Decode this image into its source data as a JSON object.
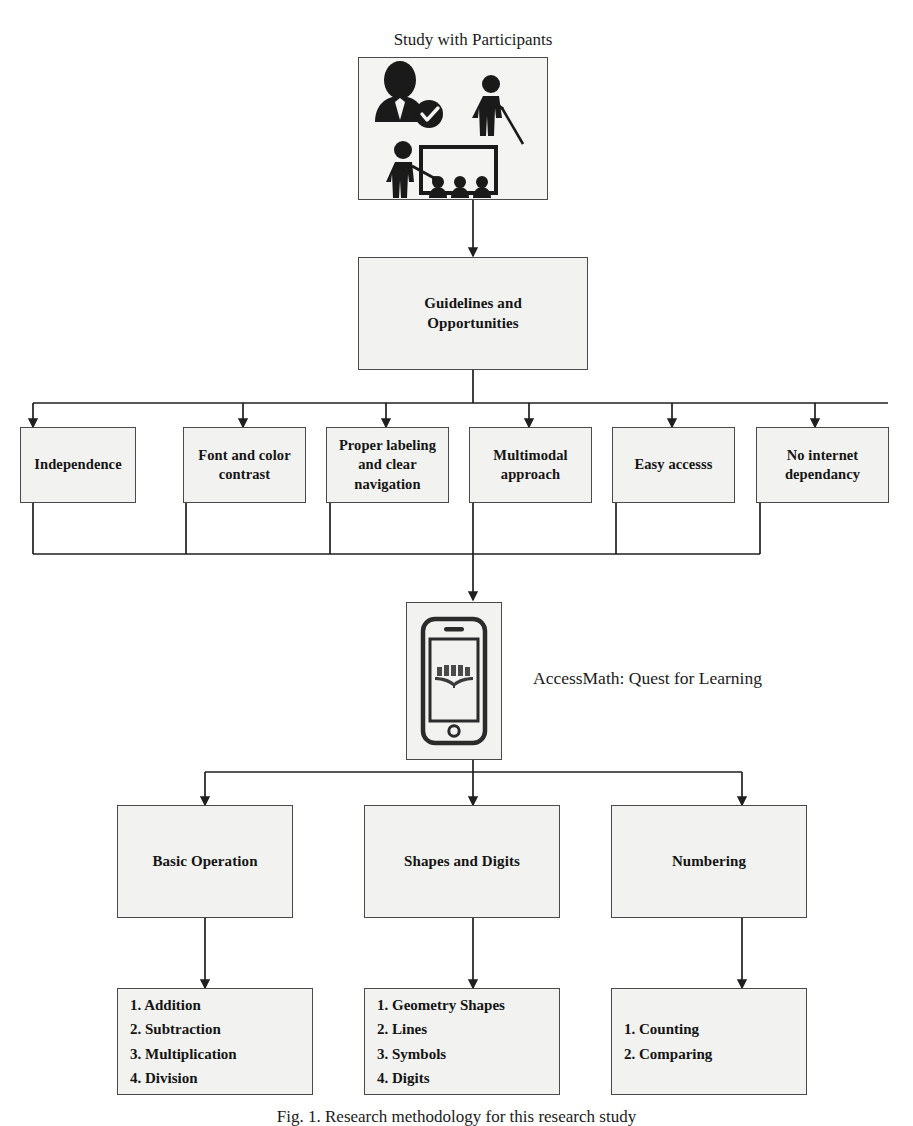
{
  "figure": {
    "title_above_image": "Study with Participants",
    "caption": "Fig. 1. Research methodology for this research study",
    "app_label": "AccessMath: Quest for Learning",
    "icons": {
      "study_image": "participants-study-icon",
      "phone": "smartphone-book-icon"
    }
  },
  "nodes": {
    "guidelines": "Guidelines and\nOpportunities",
    "guidelines_line1": "Guidelines and",
    "guidelines_line2": "Opportunities"
  },
  "guidelines_children": [
    {
      "id": "independence",
      "label": "Independence"
    },
    {
      "id": "font-contrast",
      "label": "Font and color\ncontrast",
      "line1": "Font and color",
      "line2": "contrast"
    },
    {
      "id": "proper-labeling",
      "label": "Proper labeling\nand clear\nnavigation",
      "line1": "Proper labeling",
      "line2": "and clear",
      "line3": "navigation"
    },
    {
      "id": "multimodal",
      "label": "Multimodal\napproach",
      "line1": "Multimodal",
      "line2": "approach"
    },
    {
      "id": "easy-access",
      "label": "Easy accesss"
    },
    {
      "id": "no-internet",
      "label": "No internet\ndependancy",
      "line1": "No internet",
      "line2": "dependancy"
    }
  ],
  "app_children": [
    {
      "id": "basic-operation",
      "label": "Basic Operation",
      "items": [
        "1. Addition",
        "2. Subtraction",
        "3. Multiplication",
        "4. Division"
      ]
    },
    {
      "id": "shapes-and-digits",
      "label": "Shapes and Digits",
      "items": [
        "1. Geometry Shapes",
        "2. Lines",
        "3. Symbols",
        "4. Digits"
      ]
    },
    {
      "id": "numbering",
      "label": "Numbering",
      "items": [
        "1. Counting",
        "2. Comparing"
      ]
    }
  ],
  "colors": {
    "box_fill": "#f2f2f0",
    "box_border": "#4a4a4a",
    "line": "#1f1f1f",
    "text": "#141414",
    "page_bg": "#ffffff"
  }
}
